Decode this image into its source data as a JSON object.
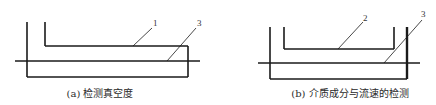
{
  "figure": {
    "panels": [
      {
        "id": "a",
        "caption": "(a) 检测真空度",
        "labels": [
          {
            "text": "1",
            "x": 155,
            "y": 25
          },
          {
            "text": "3",
            "x": 199,
            "y": 25
          }
        ]
      },
      {
        "id": "b",
        "caption": "(b) 介质成分与流速的检测",
        "labels": [
          {
            "text": "2",
            "x": 366,
            "y": 21
          },
          {
            "text": "3",
            "x": 424,
            "y": 18
          }
        ]
      }
    ],
    "colors": {
      "line": "#1a1a1a",
      "text": "#2a2a2a",
      "background": "#ffffff"
    }
  }
}
